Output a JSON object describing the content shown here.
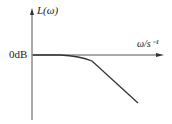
{
  "diagram": {
    "type": "bode-magnitude-plot",
    "y_axis_label": "L(ω)",
    "x_axis_label": "ω/s⁻¹",
    "reference_label": "0dB",
    "curve": "low-pass: flat at 0dB, then rolling off with negative slope",
    "colors": {
      "stroke": "#333333",
      "background": "#ffffff"
    }
  }
}
